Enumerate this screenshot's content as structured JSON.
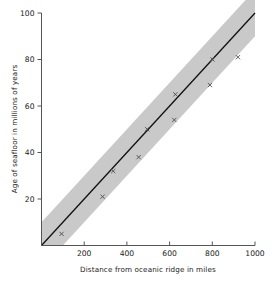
{
  "chart_data": {
    "type": "scatter",
    "title": "",
    "subtitle": "",
    "xlabel": "Distance from oceanic ridge in miles",
    "ylabel": "Age of seafloor in millions of years",
    "xlim": [
      0,
      1000
    ],
    "ylim": [
      0,
      100
    ],
    "xticks": [
      200,
      400,
      600,
      800,
      1000
    ],
    "xtick_labels": [
      "200",
      "400",
      "600",
      "800",
      "1000"
    ],
    "yticks": [
      20,
      40,
      60,
      80,
      100
    ],
    "ytick_labels": [
      "20",
      "40",
      "60",
      "80",
      "100"
    ],
    "grid": false,
    "legend": null,
    "marker": "x",
    "marker_color": "#4d4d4d",
    "line_color": "#111111",
    "band_color": "#c9c9c9",
    "axis_color": "#555555",
    "points": [
      {
        "x": 94,
        "y": 5
      },
      {
        "x": 286,
        "y": 21
      },
      {
        "x": 336,
        "y": 32
      },
      {
        "x": 455,
        "y": 38
      },
      {
        "x": 495,
        "y": 50
      },
      {
        "x": 622,
        "y": 54
      },
      {
        "x": 627,
        "y": 65
      },
      {
        "x": 789,
        "y": 69
      },
      {
        "x": 801,
        "y": 80
      },
      {
        "x": 920,
        "y": 81
      }
    ],
    "fit_line": {
      "name": "best fit line",
      "x": [
        0,
        1000
      ],
      "y": [
        0,
        100
      ]
    },
    "confidence_band": {
      "name": "uncertainty band",
      "x": [
        0,
        1000
      ],
      "y_lower": [
        -10,
        90
      ],
      "y_upper": [
        10,
        110
      ]
    }
  }
}
